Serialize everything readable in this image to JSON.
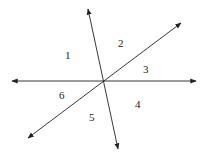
{
  "diagram": {
    "center": [
      104,
      81
    ],
    "lines": [
      {
        "name": "horizontal-line",
        "from": [
          12,
          81
        ],
        "to": [
          196,
          81
        ]
      },
      {
        "name": "steep-line",
        "from": [
          88,
          9
        ],
        "to": [
          118,
          149
        ]
      },
      {
        "name": "diagonal-line",
        "from": [
          28,
          138
        ],
        "to": [
          181,
          23
        ]
      }
    ],
    "angle_labels": [
      {
        "text": "1",
        "x": 68,
        "y": 58
      },
      {
        "text": "2",
        "x": 121,
        "y": 46
      },
      {
        "text": "3",
        "x": 146,
        "y": 72
      },
      {
        "text": "4",
        "x": 138,
        "y": 107
      },
      {
        "text": "5",
        "x": 92,
        "y": 120
      },
      {
        "text": "6",
        "x": 62,
        "y": 98
      }
    ],
    "stroke_color": "#222222"
  }
}
